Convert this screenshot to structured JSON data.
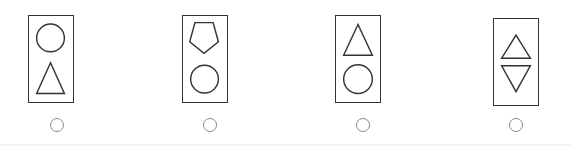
{
  "question": {
    "options": [
      {
        "index": 1,
        "shapes": [
          "circle-icon",
          "triangle-up-icon"
        ],
        "stroke_color": "#333333",
        "selected": false
      },
      {
        "index": 2,
        "shapes": [
          "pentagon-icon",
          "circle-icon"
        ],
        "stroke_color": "#333333",
        "selected": false
      },
      {
        "index": 3,
        "shapes": [
          "triangle-up-icon",
          "circle-icon"
        ],
        "stroke_color": "#333333",
        "selected": false
      },
      {
        "index": 4,
        "shapes": [
          "triangle-up-icon",
          "triangle-down-icon"
        ],
        "stroke_color": "#333333",
        "selected": false
      }
    ],
    "radio_border_color": "#8a8a8a"
  }
}
